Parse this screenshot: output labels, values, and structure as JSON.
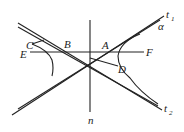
{
  "figure": {
    "labels": {
      "C": "C",
      "B": "B",
      "A": "A",
      "E": "E",
      "F": "F",
      "D": "D",
      "n": "n",
      "t1_main": "t",
      "t1_sub": "1",
      "t2_main": "t",
      "t2_sub": "2",
      "alpha": "α"
    },
    "color": "#222222"
  }
}
